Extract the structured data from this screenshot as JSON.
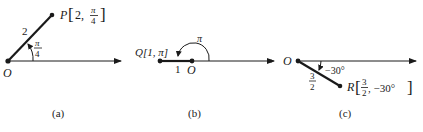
{
  "panels": [
    {
      "id": "a",
      "caption": "(a)",
      "origin_label": "O",
      "point_name": "P",
      "radius": "2",
      "angle_num": "π",
      "angle_den": "4",
      "point_label_r": "2,",
      "point_label_theta_num": "π",
      "point_label_theta_den": "4"
    },
    {
      "id": "b",
      "caption": "(b)",
      "origin_label": "O",
      "point_label": "Q[1, π]",
      "radius": "1",
      "angle": "π"
    },
    {
      "id": "c",
      "caption": "(c)",
      "origin_label": "O",
      "point_name": "R",
      "radius_num": "3",
      "radius_den": "2",
      "angle": "−30°",
      "point_label_r_num": "3",
      "point_label_r_den": "2",
      "point_label_theta": ", −30°"
    }
  ]
}
